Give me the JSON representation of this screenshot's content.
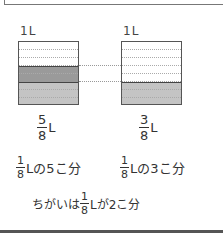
{
  "beakers": [
    {
      "label": "1L",
      "filled_eighths": 5,
      "fraction": {
        "num": "5",
        "den": "8"
      },
      "unit": "L",
      "description": {
        "frac": {
          "num": "1",
          "den": "8"
        },
        "text": "Lの5こ分"
      }
    },
    {
      "label": "1L",
      "filled_eighths": 3,
      "fraction": {
        "num": "3",
        "den": "8"
      },
      "unit": "L",
      "description": {
        "frac": {
          "num": "1",
          "den": "8"
        },
        "text": "Lの3こ分"
      }
    }
  ],
  "difference": {
    "prefix": "ちがいは",
    "frac": {
      "num": "1",
      "den": "8"
    },
    "suffix": "Lが2こ分"
  },
  "colors": {
    "dark_fill": "#9a9a9a",
    "light_fill": "#c4c4c4",
    "border": "#555555"
  }
}
